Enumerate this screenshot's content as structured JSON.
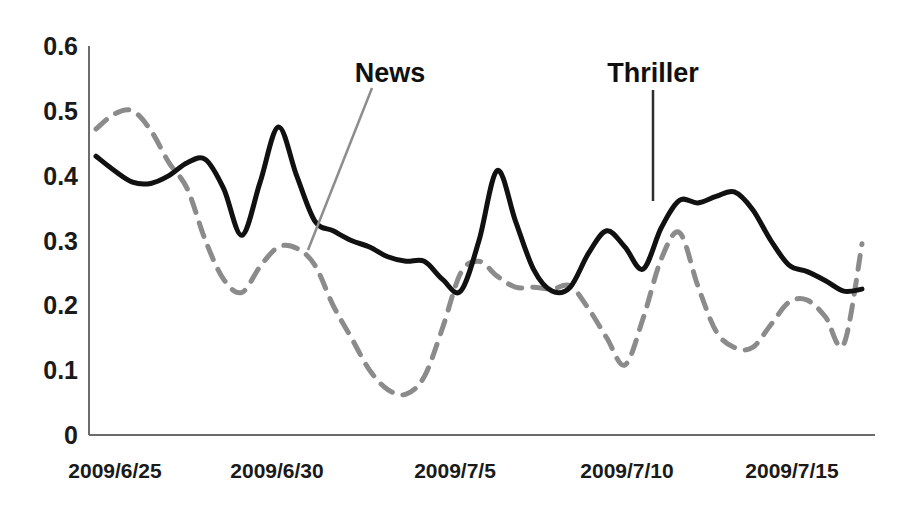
{
  "chart_data": {
    "type": "line",
    "title": "",
    "xlabel": "",
    "ylabel": "",
    "ylim": [
      0,
      0.6
    ],
    "yticks": [
      "0",
      "0.1",
      "0.2",
      "0.3",
      "0.4",
      "0.5",
      "0.6"
    ],
    "ytick_values": [
      0,
      0.1,
      0.2,
      0.3,
      0.4,
      0.5,
      0.6
    ],
    "xticks": [
      "2009/6/25",
      "2009/6/30",
      "2009/7/5",
      "2009/7/10",
      "2009/7/15"
    ],
    "xtick_values": [
      "2009-06-25",
      "2009-06-30",
      "2009-07-05",
      "2009-07-10",
      "2009-07-15"
    ],
    "xlim": [
      "2009/6/25",
      "2009/7/16"
    ],
    "grid": false,
    "legend": "annotations-on-plot",
    "annotations": [
      {
        "text": "News",
        "series": "News",
        "label_x": 390,
        "label_y": 82,
        "leader_from_x": 372,
        "leader_from_y": 88,
        "leader_to_x": 308,
        "leader_to_y": 250
      },
      {
        "text": "Thriller",
        "series": "Thriller",
        "label_x": 653,
        "label_y": 82,
        "leader_from_x": 653,
        "leader_from_y": 90,
        "leader_to_x": 653,
        "leader_to_y": 201
      }
    ],
    "series": [
      {
        "name": "Thriller",
        "style": "solid",
        "color": "#111111",
        "width": 5,
        "x": [
          "2009/6/25",
          "2009/6/25.5",
          "2009/6/26",
          "2009/6/26.5",
          "2009/6/27",
          "2009/6/27.5",
          "2009/6/28",
          "2009/6/28.5",
          "2009/6/29",
          "2009/6/29.5",
          "2009/6/30",
          "2009/6/30.5",
          "2009/7/1",
          "2009/7/1.5",
          "2009/7/2",
          "2009/7/2.5",
          "2009/7/3",
          "2009/7/3.5",
          "2009/7/4",
          "2009/7/4.5",
          "2009/7/5",
          "2009/7/5.5",
          "2009/7/6",
          "2009/7/6.5",
          "2009/7/7",
          "2009/7/7.5",
          "2009/7/8",
          "2009/7/8.5",
          "2009/7/9",
          "2009/7/9.5",
          "2009/7/10",
          "2009/7/10.5",
          "2009/7/11",
          "2009/7/11.5",
          "2009/7/12",
          "2009/7/12.5",
          "2009/7/13",
          "2009/7/13.5",
          "2009/7/14",
          "2009/7/14.5",
          "2009/7/15",
          "2009/7/15.5",
          "2009/7/16"
        ],
        "values": [
          0.43,
          0.408,
          0.39,
          0.388,
          0.4,
          0.42,
          0.425,
          0.38,
          0.308,
          0.39,
          0.475,
          0.4,
          0.33,
          0.315,
          0.3,
          0.29,
          0.275,
          0.268,
          0.268,
          0.24,
          0.222,
          0.3,
          0.408,
          0.33,
          0.255,
          0.222,
          0.228,
          0.28,
          0.315,
          0.29,
          0.256,
          0.32,
          0.362,
          0.358,
          0.368,
          0.375,
          0.348,
          0.3,
          0.262,
          0.252,
          0.238,
          0.222,
          0.225
        ]
      },
      {
        "name": "News",
        "style": "dashed",
        "color": "#8b8b8b",
        "width": 5,
        "dash": "14,11",
        "x": [
          "2009/6/25",
          "2009/6/25.5",
          "2009/6/26",
          "2009/6/26.5",
          "2009/6/27",
          "2009/6/27.5",
          "2009/6/28",
          "2009/6/28.5",
          "2009/6/29",
          "2009/6/29.5",
          "2009/6/30",
          "2009/6/30.5",
          "2009/7/1",
          "2009/7/1.5",
          "2009/7/2",
          "2009/7/2.5",
          "2009/7/3",
          "2009/7/3.5",
          "2009/7/4",
          "2009/7/4.5",
          "2009/7/5",
          "2009/7/5.5",
          "2009/7/6",
          "2009/7/6.5",
          "2009/7/7",
          "2009/7/7.5",
          "2009/7/8",
          "2009/7/8.5",
          "2009/7/9",
          "2009/7/9.5",
          "2009/7/10",
          "2009/7/10.5",
          "2009/7/11",
          "2009/7/11.5",
          "2009/7/12",
          "2009/7/12.5",
          "2009/7/13",
          "2009/7/13.5",
          "2009/7/14",
          "2009/7/14.5",
          "2009/7/15",
          "2009/7/15.5",
          "2009/7/16"
        ],
        "values": [
          0.472,
          0.495,
          0.5,
          0.47,
          0.42,
          0.38,
          0.3,
          0.24,
          0.22,
          0.26,
          0.29,
          0.288,
          0.262,
          0.2,
          0.15,
          0.1,
          0.07,
          0.063,
          0.09,
          0.165,
          0.25,
          0.268,
          0.245,
          0.228,
          0.228,
          0.225,
          0.23,
          0.195,
          0.15,
          0.108,
          0.18,
          0.272,
          0.312,
          0.23,
          0.16,
          0.135,
          0.135,
          0.17,
          0.205,
          0.208,
          0.182,
          0.14,
          0.295
        ]
      }
    ]
  },
  "axes": {
    "axis_color": "#6b6b6b",
    "origin_label": "0"
  }
}
